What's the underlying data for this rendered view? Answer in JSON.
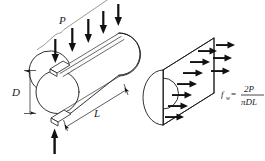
{
  "figure": {
    "background_color": "#ffffff",
    "line_color": "#1a1a1a",
    "arrow_color": "#111111"
  },
  "left_diagram": {
    "name": "loaded-cylinder",
    "labels": {
      "applied_load": "P",
      "diameter": "D",
      "length": "L"
    },
    "top_load_arrow_count": 5,
    "bottom_reaction_arrow_count": 1,
    "bearing_plate_count": 2,
    "end_shape": "circle"
  },
  "right_diagram": {
    "name": "split-half-free-body",
    "end_shape": "semicircle",
    "stress_arrow_rows": 2,
    "stress_arrows_top_row": 6,
    "stress_arrows_bottom_row": 6,
    "arrow_direction": "horizontal-right"
  },
  "formula": {
    "symbol": "f",
    "subscript": "w",
    "equals": "=",
    "numerator": "2P",
    "denominator": "πDL",
    "full_text": "f_w = 2P / (πDL)"
  }
}
